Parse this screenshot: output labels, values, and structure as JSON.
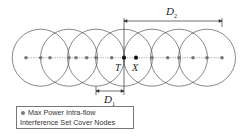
{
  "diagram": {
    "labels": {
      "T": "T",
      "X": "X",
      "D1": "D",
      "D1_sub": "1",
      "D2": "D",
      "D2_sub": "2"
    },
    "legend": {
      "line1": "Max Power Intra-flow",
      "line2": "Interference Set Cover Nodes"
    },
    "colors": {
      "circle": "#555555",
      "gray_node": "#777777",
      "black_node": "#111111",
      "line": "#888888"
    },
    "circle_centers_x": [
      40.7,
      69,
      96,
      124,
      152,
      179,
      207
    ],
    "circle_radius": 28.5,
    "axis_y": 57.7,
    "gray_nodes_x": [
      26,
      40.7,
      50,
      69,
      76,
      86.7,
      96,
      111.7,
      152,
      167.7,
      179,
      193,
      207,
      222
    ],
    "black_nodes_x": [
      124,
      136
    ]
  }
}
